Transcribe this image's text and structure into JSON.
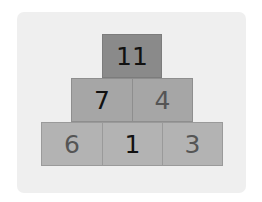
{
  "pyramid": {
    "rows": [
      [
        {
          "value": "11",
          "style": "given"
        }
      ],
      [
        {
          "value": "7",
          "style": "given"
        },
        {
          "value": "4",
          "style": "derived"
        }
      ],
      [
        {
          "value": "6",
          "style": "derived"
        },
        {
          "value": "1",
          "style": "given"
        },
        {
          "value": "3",
          "style": "derived"
        }
      ]
    ]
  },
  "colors": {
    "card": "#efefef",
    "top_row": "#8a8a8a",
    "middle_row": "#a6a6a6",
    "bottom_row": "#b3b3b3",
    "given_text": "#111111",
    "derived_text": "#555555"
  }
}
